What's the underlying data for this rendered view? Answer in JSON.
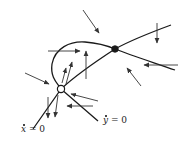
{
  "diagram": {
    "type": "phase-plane",
    "colors": {
      "stroke": "#1a1a1a",
      "arrow": "#333333",
      "background": "#ffffff"
    },
    "nullclines": [
      {
        "id": "xdot-zero",
        "var": "x",
        "rhs": "0",
        "label_eq": " = 0"
      },
      {
        "id": "ydot-zero",
        "var": "y",
        "rhs": "0",
        "label_eq": " = 0"
      }
    ],
    "equilibria": [
      {
        "id": "eq-open",
        "style": "hollow",
        "x": 61,
        "y": 89
      },
      {
        "id": "eq-filled",
        "style": "filled",
        "x": 115,
        "y": 49
      }
    ]
  }
}
